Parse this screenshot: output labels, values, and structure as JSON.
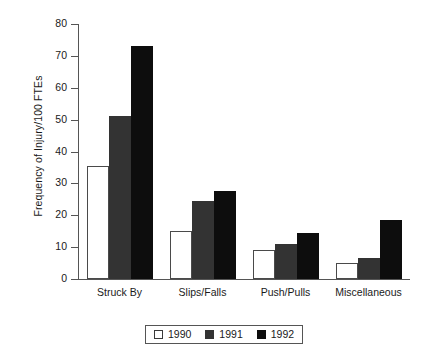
{
  "chart_data": {
    "type": "bar",
    "title": "",
    "xlabel": "",
    "ylabel": "Frequency of Injury/100 FTEs",
    "categories": [
      "Struck By",
      "Slips/Falls",
      "Push/Pulls",
      "Miscellaneous"
    ],
    "series": [
      {
        "name": "1990",
        "color": "#ffffff",
        "values": [
          35.5,
          15,
          9,
          5
        ]
      },
      {
        "name": "1991",
        "color": "#333333",
        "values": [
          51,
          24.5,
          11,
          6.5
        ]
      },
      {
        "name": "1992",
        "color": "#0d0d0d",
        "values": [
          73,
          27.5,
          14.5,
          18.5
        ]
      }
    ],
    "ylim": [
      0,
      80
    ],
    "yticks": [
      0,
      10,
      20,
      30,
      40,
      50,
      60,
      70,
      80
    ],
    "ytick_labels": [
      "0",
      "10",
      "20",
      "30",
      "40",
      "50",
      "60",
      "70",
      "80"
    ],
    "grid": false,
    "legend_position": "bottom"
  },
  "legend": {
    "entries": [
      {
        "label": "1990"
      },
      {
        "label": "1991"
      },
      {
        "label": "1992"
      }
    ]
  }
}
